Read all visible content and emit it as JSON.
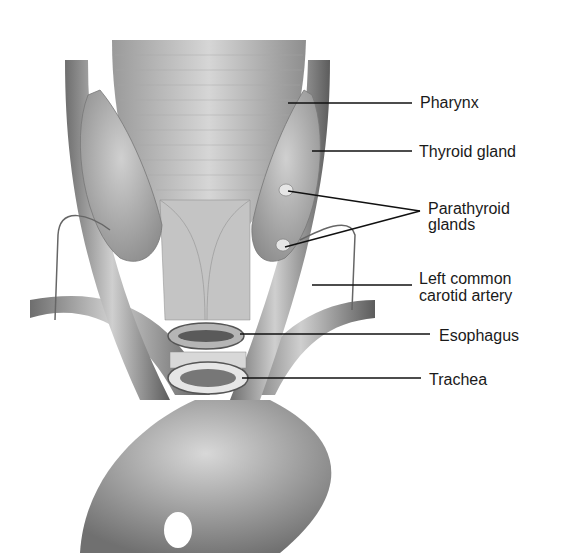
{
  "diagram": {
    "labels": [
      {
        "id": "pharynx",
        "text": "Pharynx",
        "x": 420,
        "y": 101,
        "line": {
          "x1": 288,
          "y1": 103,
          "x2": 412,
          "y2": 103
        }
      },
      {
        "id": "thyroid",
        "text": "Thyroid gland",
        "x": 419,
        "y": 150,
        "line": {
          "x1": 312,
          "y1": 151,
          "x2": 412,
          "y2": 151
        }
      },
      {
        "id": "parathyroid",
        "text": "Parathyroid",
        "text2": "glands",
        "x": 428,
        "y": 200
      },
      {
        "id": "left-carotid",
        "text": "Left common",
        "text2": "carotid artery",
        "x": 419,
        "y": 270,
        "line": {
          "x1": 312,
          "y1": 285,
          "x2": 412,
          "y2": 285
        }
      },
      {
        "id": "esophagus",
        "text": "Esophagus",
        "x": 439,
        "y": 328,
        "line": {
          "x1": 240,
          "y1": 334,
          "x2": 430,
          "y2": 334
        }
      },
      {
        "id": "trachea",
        "text": "Trachea",
        "x": 429,
        "y": 371,
        "line": {
          "x1": 242,
          "y1": 378,
          "x2": 421,
          "y2": 378
        }
      }
    ],
    "parathyroid_lines": [
      {
        "x1": 288,
        "y1": 191,
        "x2": 420,
        "y2": 211
      },
      {
        "x1": 285,
        "y1": 247,
        "x2": 420,
        "y2": 211
      }
    ]
  }
}
